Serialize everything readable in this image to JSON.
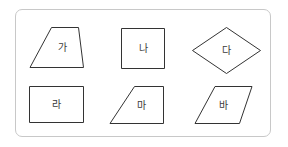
{
  "figure": {
    "stroke_color": "#333333",
    "card_border_color": "#c8c8c8",
    "shapes": [
      {
        "id": "ga",
        "label": "가",
        "type": "trapezoid",
        "points": "51.5,27.5 78.5,27.5 83.5,67.5 30,67.5",
        "label_x": 62,
        "label_y": 51
      },
      {
        "id": "na",
        "label": "나",
        "type": "square",
        "points": "121.5,28.5 164.5,28.5 164.5,68.5 121.5,68.5",
        "label_x": 143,
        "label_y": 52
      },
      {
        "id": "da",
        "label": "다",
        "type": "rhombus",
        "points": "226.5,27.5 260.5,50.5 226.5,73.5 192.5,50.5",
        "label_x": 226.5,
        "label_y": 54
      },
      {
        "id": "ra",
        "label": "라",
        "type": "rectangle",
        "points": "29.5,86.5 83.5,86.5 83.5,122.5 29.5,122.5",
        "label_x": 56.5,
        "label_y": 108
      },
      {
        "id": "ma",
        "label": "마",
        "type": "right-trapezoid",
        "points": "134.5,86.5 163.5,86.5 163.5,123.5 110,123.5",
        "label_x": 141,
        "label_y": 109
      },
      {
        "id": "ba",
        "label": "바",
        "type": "parallelogram",
        "points": "215,86.5 252,86.5 239.5,123.5 195,123.5",
        "label_x": 223.5,
        "label_y": 109
      }
    ]
  }
}
